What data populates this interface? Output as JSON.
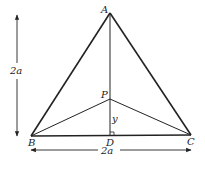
{
  "diagram": {
    "type": "geometry",
    "points": {
      "A": {
        "label": "A",
        "x": 110,
        "y": 13
      },
      "B": {
        "label": "B",
        "x": 31,
        "y": 136
      },
      "C": {
        "label": "C",
        "x": 191,
        "y": 135
      },
      "D": {
        "label": "D",
        "x": 110,
        "y": 136
      },
      "P": {
        "label": "P",
        "x": 110,
        "y": 99
      }
    },
    "segments": [
      "AB",
      "AC",
      "BC",
      "AD",
      "PB",
      "PC"
    ],
    "labels": {
      "height": "2a",
      "base": "2a",
      "pd": "y"
    },
    "right_angle_at": "D",
    "colors": {
      "stroke": "#222222",
      "background": "#ffffff"
    }
  }
}
